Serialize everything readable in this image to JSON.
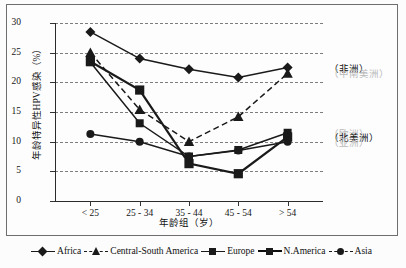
{
  "chart": {
    "type": "line",
    "title": "",
    "xlabel": "年龄组（岁）",
    "ylabel": "年龄特异性HPV感染（%）",
    "categories": [
      "< 25",
      "25 - 34",
      "35 - 44",
      "45 - 54",
      "> 54"
    ],
    "ylim": [
      0,
      30
    ],
    "yticks": [
      "0",
      "5",
      "10",
      "15",
      "20",
      "25",
      "30"
    ],
    "grid": true,
    "legend_position": "bottom",
    "series": [
      {
        "name": "Africa",
        "marker": "diamond",
        "style": "solid",
        "values": [
          28.5,
          24.0,
          22.2,
          20.8,
          22.5
        ]
      },
      {
        "name": "Central-South America",
        "marker": "triangle",
        "style": "dashed",
        "values": [
          25.0,
          15.4,
          10.0,
          14.2,
          21.5
        ]
      },
      {
        "name": "Europe",
        "marker": "square",
        "style": "solid",
        "values": [
          23.4,
          13.1,
          7.5,
          8.6,
          11.5
        ]
      },
      {
        "name": "N.America",
        "marker": "square",
        "style": "thick",
        "values": [
          23.5,
          18.7,
          6.3,
          4.6,
          10.8
        ]
      },
      {
        "name": "Asia",
        "marker": "circle",
        "style": "solid",
        "values": [
          11.3,
          10.0,
          7.5,
          8.5,
          10.0
        ]
      }
    ]
  },
  "annotations": [
    {
      "text": "（非洲）",
      "faded": false
    },
    {
      "text": "（中南美洲）",
      "faded": true
    },
    {
      "text": "（欧洲）",
      "faded": true
    },
    {
      "text": "（北美洲）",
      "faded": false
    },
    {
      "text": "（亚洲）",
      "faded": true
    }
  ],
  "legend": {
    "items": [
      {
        "label": "Africa",
        "marker": "diamond",
        "style": "solid"
      },
      {
        "label": "Central-South America",
        "marker": "triangle",
        "style": "dashed"
      },
      {
        "label": "Europe",
        "marker": "square",
        "style": "solid"
      },
      {
        "label": "N.America",
        "marker": "square",
        "style": "thick"
      },
      {
        "label": "Asia",
        "marker": "circle",
        "style": "dashed"
      }
    ]
  },
  "colors": {
    "line": "#1a1a1a",
    "grid": "#7d7d7d",
    "axis": "#2b2b2b",
    "frame": "#6e6e6e",
    "annotation_faded": "#b9b9b9",
    "annotation_dark": "#111111",
    "background": "#fdfdfd"
  }
}
